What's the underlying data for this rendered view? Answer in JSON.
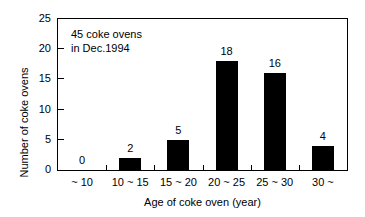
{
  "chart_data": {
    "type": "bar",
    "title": "",
    "categories": [
      "~ 10",
      "10 ~ 15",
      "15 ~ 20",
      "20 ~ 25",
      "25 ~ 30",
      "30 ~"
    ],
    "values": [
      0,
      2,
      5,
      18,
      16,
      4
    ],
    "value_labels": [
      "0",
      "2",
      "5",
      "18",
      "16",
      "4"
    ],
    "xlabel": "Age of coke oven (year)",
    "ylabel": "Number of coke ovens",
    "ylim": [
      0,
      25
    ],
    "ytick_labels": [
      "0",
      "5",
      "10",
      "15",
      "20",
      "25"
    ],
    "ytick_values": [
      0,
      5,
      10,
      15,
      20,
      25
    ],
    "grid": false,
    "legend": null,
    "bar_color": "#000000",
    "background_color": "#ffffff",
    "axis_color": "#000000",
    "annotations": [
      "45 coke ovens",
      "in Dec.1994"
    ]
  }
}
